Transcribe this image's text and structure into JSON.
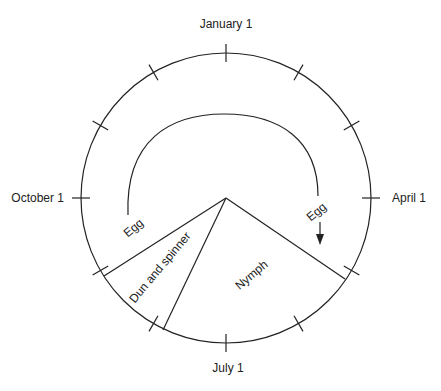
{
  "diagram": {
    "type": "annual life cycle wheel",
    "month_labels": {
      "top": "January 1",
      "right": "April 1",
      "bottom": "July 1",
      "left": "October 1"
    },
    "tick_count": 12,
    "stages": [
      {
        "name": "Egg",
        "label": "Egg"
      },
      {
        "name": "Nymph",
        "label": "Nymph"
      },
      {
        "name": "Dun and spinner",
        "label": "Dun and spinner"
      }
    ],
    "egg_arc": {
      "start_label": "Egg",
      "end_label": "Egg",
      "direction": "arrow-down"
    }
  }
}
